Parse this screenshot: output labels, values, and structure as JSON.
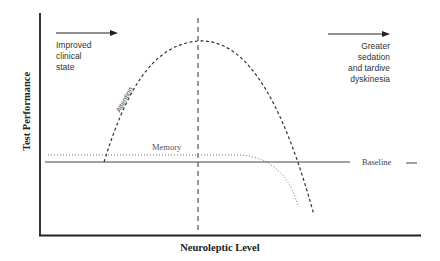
{
  "diagram": {
    "y_axis_label": "Test Performance",
    "x_axis_label": "Neuroleptic Level",
    "left_annotation": [
      "Improved",
      "clinical",
      "state"
    ],
    "right_annotation": [
      "Greater",
      "sedation",
      "and tardive",
      "dyskinesia"
    ],
    "curves": {
      "attention": "Attention",
      "memory": "Memory",
      "baseline": "Baseline"
    },
    "colors": {
      "line": "#222222",
      "dotted": "#777777",
      "text": "#333333"
    }
  }
}
